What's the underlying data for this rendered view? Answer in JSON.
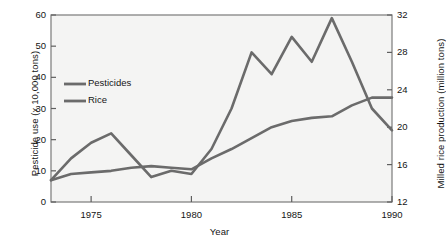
{
  "chart_data": {
    "type": "line",
    "title": "",
    "xlabel": "Year",
    "ylabel": "Pesticide use (x 10,000 tons)",
    "ylabel_right": "Milled rice production (million tons)",
    "xlim": [
      1973,
      1990
    ],
    "ylim": [
      0,
      60
    ],
    "ylim_right": [
      12,
      32
    ],
    "grid": false,
    "legend_position": "upper-left-inside",
    "xticks": [
      1975,
      1980,
      1985,
      1990
    ],
    "xtick_labels": [
      "1975",
      "1980",
      "1985",
      "1990"
    ],
    "yticks_left": [
      0,
      10,
      20,
      30,
      40,
      50,
      60
    ],
    "ytick_labels_left": [
      "0",
      "10",
      "20",
      "30",
      "40",
      "50",
      "60"
    ],
    "yticks_right": [
      12,
      16,
      20,
      24,
      28,
      32
    ],
    "ytick_labels_right": [
      "12",
      "16",
      "20",
      "24",
      "28",
      "32"
    ],
    "line_color": "#6b6b6b",
    "series": [
      {
        "name": "Pesticides",
        "axis": "left",
        "units": "x 10,000 tons",
        "x": [
          1973,
          1974,
          1975,
          1976,
          1977,
          1978,
          1979,
          1980,
          1981,
          1982,
          1983,
          1984,
          1985,
          1986,
          1987,
          1988,
          1989,
          1990
        ],
        "values": [
          7,
          14,
          19,
          22,
          15,
          8,
          10,
          9,
          17,
          30,
          48,
          41,
          53,
          45,
          59,
          45,
          30,
          23
        ]
      },
      {
        "name": "Rice",
        "axis": "right",
        "units": "million tons",
        "x": [
          1973,
          1974,
          1975,
          1976,
          1977,
          1978,
          1979,
          1980,
          1981,
          1982,
          1983,
          1984,
          1985,
          1986,
          1987,
          1988,
          1989,
          1990
        ],
        "values_left_scale": [
          7,
          9,
          9.5,
          10,
          11,
          11.5,
          11,
          10.5,
          14,
          17,
          20.5,
          24,
          26,
          27,
          27.5,
          31,
          33.5,
          33.5
        ],
        "values": [
          14.3,
          15.0,
          15.2,
          15.3,
          15.7,
          15.8,
          15.7,
          15.5,
          16.7,
          17.7,
          18.8,
          20.0,
          20.7,
          21.0,
          21.2,
          22.3,
          23.2,
          23.2
        ]
      }
    ],
    "legend": [
      {
        "label": "Pesticides",
        "color": "#6b6b6b"
      },
      {
        "label": "Rice",
        "color": "#6b6b6b"
      }
    ]
  }
}
